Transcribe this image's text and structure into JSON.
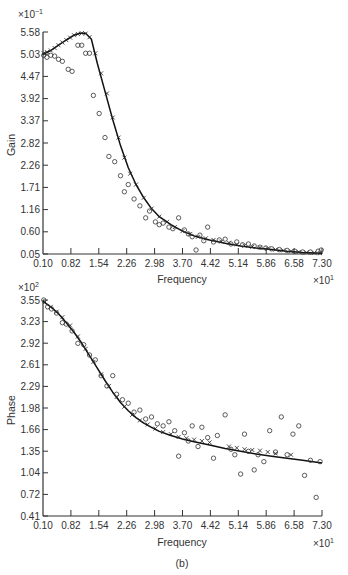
{
  "figure": {
    "panel_label": "(b)"
  },
  "chart_data": [
    {
      "type": "line",
      "id": "gain",
      "title": "",
      "xlabel": "Frequency",
      "ylabel": "Gain",
      "x_multiplier": "×10",
      "x_multiplier_exp": "1",
      "y_multiplier": "×10",
      "y_multiplier_exp": "−1",
      "xlim": [
        0.1,
        7.3
      ],
      "ylim": [
        0.05,
        5.58
      ],
      "xticks": [
        "0.10",
        "0.82",
        "1.54",
        "2.26",
        "2.98",
        "3.70",
        "4.42",
        "5.14",
        "5.86",
        "6.58",
        "7.30"
      ],
      "yticks": [
        "0.05",
        "0.60",
        "1.16",
        "1.71",
        "2.26",
        "2.82",
        "3.37",
        "3.92",
        "4.47",
        "5.03",
        "5.58"
      ],
      "grid": false,
      "series": [
        {
          "name": "fitted curve",
          "style": "solid-line",
          "x": [
            0.1,
            0.3,
            0.5,
            0.7,
            0.9,
            1.05,
            1.2,
            1.35,
            1.5,
            1.7,
            1.9,
            2.1,
            2.3,
            2.5,
            2.7,
            2.9,
            3.1,
            3.4,
            3.7,
            4.0,
            4.4,
            4.8,
            5.2,
            5.6,
            6.0,
            6.4,
            6.8,
            7.3
          ],
          "y": [
            5.03,
            5.12,
            5.25,
            5.38,
            5.5,
            5.55,
            5.55,
            5.4,
            4.8,
            4.1,
            3.4,
            2.75,
            2.2,
            1.78,
            1.45,
            1.18,
            0.98,
            0.78,
            0.62,
            0.5,
            0.4,
            0.32,
            0.25,
            0.2,
            0.16,
            0.12,
            0.09,
            0.07
          ]
        },
        {
          "name": "model points",
          "style": "cross-marker",
          "x": [
            0.12,
            0.2,
            0.3,
            0.4,
            0.5,
            0.6,
            0.7,
            0.8,
            0.9,
            1.0,
            1.1,
            1.2,
            1.3,
            1.45,
            1.6,
            1.75,
            1.9,
            2.05,
            2.2,
            2.35,
            2.5,
            2.7,
            2.9,
            3.1,
            3.3,
            3.5,
            3.7,
            3.9,
            4.1,
            4.3,
            4.5,
            4.7,
            4.9,
            5.1,
            5.3,
            5.5,
            5.7,
            5.9,
            6.1,
            6.3,
            6.5,
            6.7,
            6.9,
            7.1,
            7.25
          ],
          "y": [
            5.05,
            5.08,
            5.12,
            5.18,
            5.25,
            5.32,
            5.38,
            5.44,
            5.5,
            5.53,
            5.55,
            5.54,
            5.45,
            5.05,
            4.55,
            4.05,
            3.45,
            2.95,
            2.45,
            2.05,
            1.78,
            1.45,
            1.18,
            0.98,
            0.85,
            0.72,
            0.62,
            0.55,
            0.48,
            0.44,
            0.4,
            0.36,
            0.33,
            0.29,
            0.26,
            0.23,
            0.21,
            0.19,
            0.16,
            0.14,
            0.12,
            0.1,
            0.09,
            0.08,
            0.07
          ]
        },
        {
          "name": "measured points",
          "style": "open-circle",
          "x": [
            0.12,
            0.2,
            0.3,
            0.4,
            0.5,
            0.6,
            0.75,
            0.85,
            1.0,
            1.1,
            1.2,
            1.3,
            1.4,
            1.55,
            1.7,
            1.8,
            1.95,
            2.1,
            2.2,
            2.3,
            2.45,
            2.6,
            2.75,
            2.85,
            3.0,
            3.1,
            3.2,
            3.35,
            3.45,
            3.6,
            3.75,
            3.85,
            3.95,
            4.05,
            4.15,
            4.25,
            4.35,
            4.5,
            4.65,
            4.8,
            4.95,
            5.1,
            5.25,
            5.4,
            5.55,
            5.7,
            5.85,
            6.0,
            6.2,
            6.4,
            6.6,
            6.8,
            7.0,
            7.2,
            7.28
          ],
          "y": [
            5.0,
            4.95,
            5.0,
            4.98,
            4.9,
            4.85,
            4.65,
            4.6,
            5.25,
            5.25,
            5.05,
            5.05,
            4.0,
            3.55,
            2.95,
            2.48,
            2.35,
            2.0,
            1.6,
            1.78,
            1.42,
            1.25,
            0.95,
            1.12,
            0.85,
            0.78,
            0.82,
            0.72,
            0.68,
            0.95,
            0.65,
            0.55,
            0.48,
            0.15,
            0.52,
            0.38,
            0.72,
            0.35,
            0.4,
            0.42,
            0.3,
            0.35,
            0.28,
            0.3,
            0.25,
            0.22,
            0.2,
            0.18,
            0.16,
            0.14,
            0.12,
            0.1,
            0.1,
            0.12,
            0.15
          ]
        }
      ]
    },
    {
      "type": "line",
      "id": "phase",
      "title": "",
      "xlabel": "Frequency",
      "ylabel": "Phase",
      "x_multiplier": "×10",
      "x_multiplier_exp": "1",
      "y_multiplier": "×10",
      "y_multiplier_exp": "2",
      "xlim": [
        0.1,
        7.3
      ],
      "ylim": [
        0.41,
        3.55
      ],
      "xticks": [
        "0.10",
        "0.82",
        "1.54",
        "2.26",
        "2.98",
        "3.70",
        "4.42",
        "5.14",
        "5.86",
        "6.58",
        "7.30"
      ],
      "yticks": [
        "0.41",
        "0.72",
        "1.04",
        "1.35",
        "1.66",
        "1.98",
        "2.29",
        "2.61",
        "2.92",
        "3.23",
        "3.55"
      ],
      "grid": false,
      "series": [
        {
          "name": "fitted curve",
          "style": "solid-line",
          "x": [
            0.1,
            0.3,
            0.5,
            0.7,
            0.9,
            1.1,
            1.3,
            1.5,
            1.7,
            1.9,
            2.1,
            2.3,
            2.5,
            2.7,
            2.9,
            3.1,
            3.4,
            3.7,
            4.0,
            4.4,
            4.8,
            5.2,
            5.6,
            6.0,
            6.4,
            6.8,
            7.3
          ],
          "y": [
            3.53,
            3.45,
            3.35,
            3.22,
            3.08,
            2.92,
            2.74,
            2.56,
            2.38,
            2.21,
            2.06,
            1.94,
            1.84,
            1.76,
            1.7,
            1.64,
            1.58,
            1.53,
            1.49,
            1.44,
            1.39,
            1.35,
            1.31,
            1.28,
            1.25,
            1.22,
            1.18
          ]
        },
        {
          "name": "model points",
          "style": "cross-marker",
          "x": [
            0.15,
            0.3,
            0.45,
            0.6,
            0.8,
            1.0,
            1.2,
            1.4,
            1.6,
            1.8,
            2.0,
            2.2,
            2.4,
            2.6,
            2.8,
            3.0,
            3.2,
            3.4,
            3.6,
            3.8,
            4.0,
            4.2,
            4.4,
            4.9,
            5.1,
            5.3,
            5.5,
            5.7,
            5.9,
            6.1,
            6.5
          ],
          "y": [
            3.52,
            3.45,
            3.38,
            3.3,
            3.18,
            3.02,
            2.84,
            2.65,
            2.47,
            2.3,
            2.14,
            2.0,
            1.88,
            1.8,
            1.74,
            1.68,
            1.63,
            1.6,
            1.56,
            1.54,
            1.52,
            1.5,
            1.48,
            1.42,
            1.4,
            1.38,
            1.37,
            1.36,
            1.34,
            1.32,
            1.3
          ]
        },
        {
          "name": "measured points",
          "style": "open-circle",
          "x": [
            0.12,
            0.22,
            0.32,
            0.45,
            0.6,
            0.7,
            0.85,
            1.0,
            1.15,
            1.3,
            1.45,
            1.6,
            1.75,
            1.9,
            2.0,
            2.15,
            2.3,
            2.45,
            2.6,
            2.75,
            2.9,
            3.05,
            3.2,
            3.35,
            3.5,
            3.6,
            3.75,
            3.85,
            3.95,
            4.1,
            4.2,
            4.35,
            4.5,
            4.6,
            4.8,
            4.95,
            5.05,
            5.2,
            5.3,
            5.4,
            5.55,
            5.65,
            5.8,
            5.95,
            6.1,
            6.25,
            6.4,
            6.55,
            6.7,
            6.85,
            7.0,
            7.15,
            7.25
          ],
          "y": [
            3.55,
            3.45,
            3.42,
            3.36,
            3.22,
            3.2,
            3.1,
            2.92,
            2.9,
            2.75,
            2.68,
            2.45,
            2.3,
            2.45,
            2.18,
            2.1,
            2.05,
            1.92,
            1.95,
            1.82,
            1.85,
            1.75,
            1.72,
            1.78,
            1.65,
            1.28,
            1.62,
            1.5,
            1.72,
            1.42,
            1.7,
            1.55,
            1.25,
            1.58,
            1.88,
            1.38,
            1.3,
            1.02,
            1.6,
            1.35,
            1.08,
            1.3,
            1.2,
            1.65,
            1.34,
            1.85,
            1.3,
            1.6,
            1.72,
            1.0,
            1.22,
            0.68,
            1.2
          ]
        }
      ]
    }
  ]
}
